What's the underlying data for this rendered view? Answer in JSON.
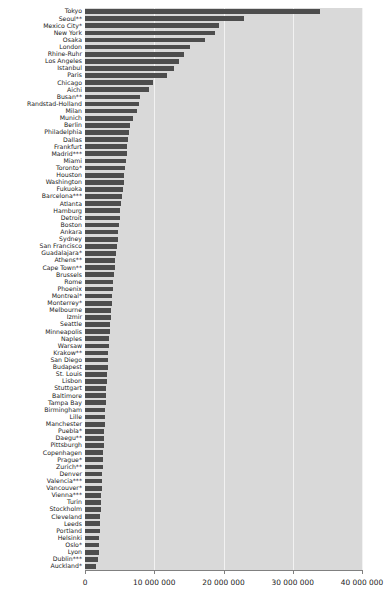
{
  "chart_data": {
    "type": "bar",
    "orientation": "horizontal",
    "title": "",
    "subtitle": "",
    "xlabel": "",
    "ylabel": "",
    "xlim": [
      0,
      40000000
    ],
    "ylim": null,
    "grid": true,
    "legend": null,
    "legend_position": "none",
    "xticks": [
      0,
      10000000,
      20000000,
      30000000,
      40000000
    ],
    "xtick_labels": [
      "0",
      "10 000 000",
      "20 000 000",
      "30 000 000",
      "40 000 000"
    ],
    "bar_color": "#4d4d4d",
    "plot_background": "#d9d9d9",
    "gridline_color": "#f2f2f2",
    "categories": [
      "Tokyo",
      "Seoul**",
      "Mexico City*",
      "New York",
      "Osaka",
      "London",
      "Rhine-Ruhr",
      "Los Angeles",
      "Istanbul",
      "Paris",
      "Chicago",
      "Aichi",
      "Busan**",
      "Randstad-Holland",
      "Milan",
      "Munich",
      "Berlin",
      "Philadelphia",
      "Dallas",
      "Frankfurt",
      "Madrid***",
      "Miami",
      "Toronto*",
      "Houston",
      "Washington",
      "Fukuoka",
      "Barcelona***",
      "Atlanta",
      "Hamburg",
      "Detroit",
      "Boston",
      "Ankara",
      "Sydney",
      "San Francisco",
      "Guadalajara*",
      "Athens**",
      "Cape Town**",
      "Brussels",
      "Rome",
      "Phoenix",
      "Montreal*",
      "Monterrey*",
      "Melbourne",
      "Izmir",
      "Seattle",
      "Minneapolis",
      "Naples",
      "Warsaw",
      "Krakow**",
      "San Diego",
      "Budapest",
      "St. Louis",
      "Lisbon",
      "Stuttgart",
      "Baltimore",
      "Tampa Bay",
      "Birmingham",
      "Lille",
      "Manchester",
      "Puebla*",
      "Daegu**",
      "Pittsburgh",
      "Copenhagen",
      "Prague*",
      "Zurich**",
      "Denver",
      "Valencia***",
      "Vancouver*",
      "Vienna***",
      "Turin",
      "Stockholm",
      "Cleveland",
      "Leeds",
      "Portland",
      "Helsinki",
      "Oslo*",
      "Lyon",
      "Dublin***",
      "Auckland*"
    ],
    "values": [
      34000000,
      23000000,
      19300000,
      18800000,
      17400000,
      15100000,
      14300000,
      13600000,
      12800000,
      11800000,
      9800000,
      9200000,
      8000000,
      7800000,
      7500000,
      6900000,
      6500000,
      6300000,
      6200000,
      6100000,
      6000000,
      5900000,
      5800000,
      5700000,
      5600000,
      5500000,
      5400000,
      5200000,
      5100000,
      5000000,
      4900000,
      4800000,
      4700000,
      4600000,
      4500000,
      4400000,
      4300000,
      4200000,
      4100000,
      4000000,
      3900000,
      3850000,
      3800000,
      3700000,
      3600000,
      3550000,
      3500000,
      3400000,
      3350000,
      3300000,
      3250000,
      3200000,
      3150000,
      3100000,
      3050000,
      3000000,
      2950000,
      2900000,
      2850000,
      2800000,
      2750000,
      2700000,
      2650000,
      2600000,
      2550000,
      2500000,
      2450000,
      2400000,
      2350000,
      2300000,
      2250000,
      2200000,
      2150000,
      2100000,
      2050000,
      2000000,
      1950000,
      1900000,
      1600000
    ]
  }
}
